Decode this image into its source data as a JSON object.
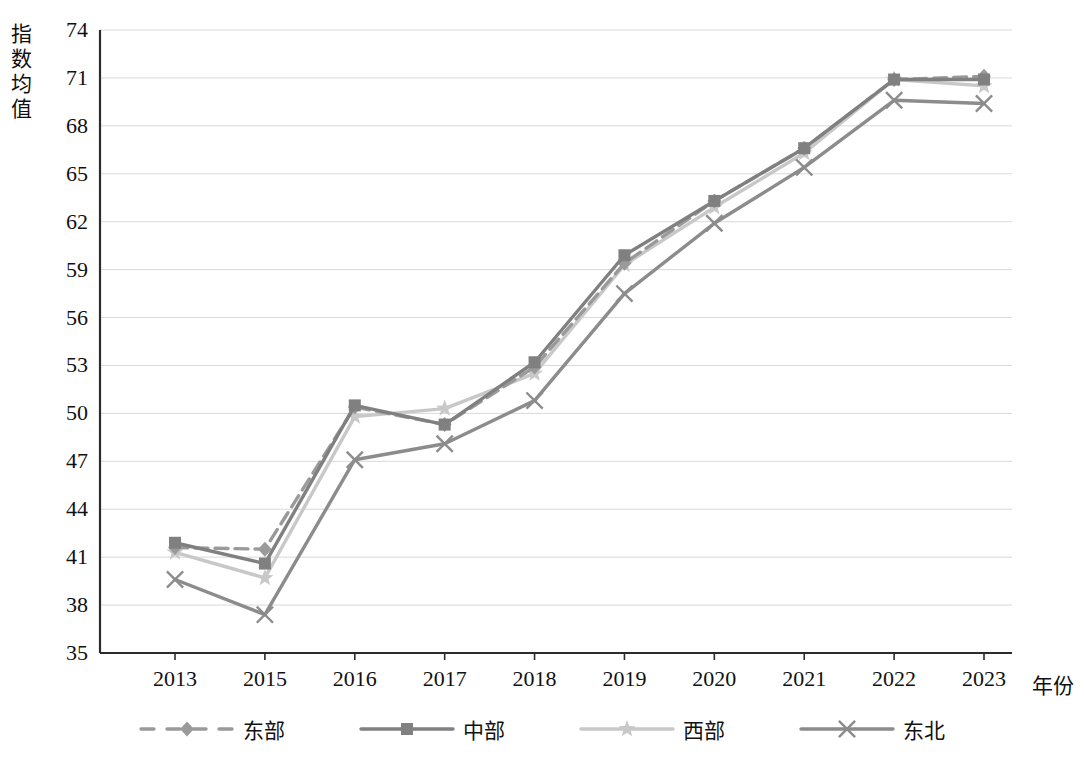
{
  "chart_data": {
    "type": "line",
    "title": "",
    "xlabel": "年份",
    "ylabel": "指数均值",
    "categories": [
      "2013",
      "2015",
      "2016",
      "2017",
      "2018",
      "2019",
      "2020",
      "2021",
      "2022",
      "2023"
    ],
    "ylim": [
      35,
      74
    ],
    "ytick_step": 3,
    "yticks": [
      "74",
      "71",
      "68",
      "65",
      "62",
      "59",
      "56",
      "53",
      "50",
      "47",
      "44",
      "41",
      "38",
      "35"
    ],
    "grid": true,
    "legend_position": "bottom",
    "series": [
      {
        "name": "东部",
        "style": "dashed",
        "marker": "diamond",
        "color": "#9a9a9a",
        "values": [
          41.6,
          41.5,
          50.4,
          49.3,
          52.9,
          59.4,
          63.3,
          66.6,
          70.9,
          71.1
        ]
      },
      {
        "name": "中部",
        "style": "solid",
        "marker": "square",
        "color": "#808080",
        "values": [
          41.9,
          40.6,
          50.5,
          49.3,
          53.2,
          59.9,
          63.3,
          66.6,
          70.9,
          70.9
        ]
      },
      {
        "name": "西部",
        "style": "solid",
        "marker": "star",
        "color": "#c8c8c8",
        "values": [
          41.3,
          39.7,
          49.8,
          50.3,
          52.5,
          59.3,
          62.9,
          66.3,
          70.9,
          70.5
        ]
      },
      {
        "name": "东北",
        "style": "solid",
        "marker": "x",
        "color": "#8c8c8c",
        "values": [
          39.6,
          37.4,
          47.1,
          48.1,
          50.8,
          57.5,
          61.9,
          65.4,
          69.6,
          69.4
        ]
      }
    ]
  },
  "axis": {
    "y_title": "指数均值",
    "x_title": "年份"
  },
  "legend": {
    "items": [
      {
        "label": "东部",
        "marker_name": "legend-marker-diamond-dashed"
      },
      {
        "label": "中部",
        "marker_name": "legend-marker-square-solid"
      },
      {
        "label": "西部",
        "marker_name": "legend-marker-star-solid"
      },
      {
        "label": "东北",
        "marker_name": "legend-marker-x-solid"
      }
    ]
  }
}
